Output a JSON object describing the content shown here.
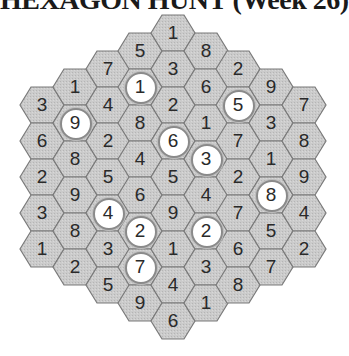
{
  "title": "HEXAGON HUNT (Week 26)",
  "colors": {
    "hex_fill": "#c9c9c9",
    "hex_border": "#7a7a7a",
    "circle_fill": "#ffffff",
    "text": "#2a2a2a"
  },
  "grid": {
    "orientation": "flat-top",
    "columns": [
      {
        "x": 42,
        "y0": 105,
        "cells": [
          {
            "v": "3"
          },
          {
            "v": "6"
          },
          {
            "v": "2"
          },
          {
            "v": "3"
          },
          {
            "v": "1"
          }
        ]
      },
      {
        "x": 75,
        "y0": 87,
        "cells": [
          {
            "v": "1"
          },
          {
            "v": "9",
            "c": true
          },
          {
            "v": "8"
          },
          {
            "v": "9"
          },
          {
            "v": "8"
          },
          {
            "v": "2"
          }
        ]
      },
      {
        "x": 108,
        "y0": 69,
        "cells": [
          {
            "v": "7"
          },
          {
            "v": "4"
          },
          {
            "v": "2"
          },
          {
            "v": "5"
          },
          {
            "v": "4",
            "c": true
          },
          {
            "v": "3"
          },
          {
            "v": "5"
          }
        ]
      },
      {
        "x": 140,
        "y0": 51,
        "cells": [
          {
            "v": "5"
          },
          {
            "v": "1",
            "c": true
          },
          {
            "v": "8"
          },
          {
            "v": "4"
          },
          {
            "v": "6"
          },
          {
            "v": "2",
            "c": true
          },
          {
            "v": "7",
            "c": true
          },
          {
            "v": "9"
          }
        ]
      },
      {
        "x": 173,
        "y0": 33,
        "cells": [
          {
            "v": "1"
          },
          {
            "v": "3"
          },
          {
            "v": "2"
          },
          {
            "v": "6",
            "c": true
          },
          {
            "v": "5"
          },
          {
            "v": "9"
          },
          {
            "v": "1"
          },
          {
            "v": "4"
          },
          {
            "v": "6"
          }
        ]
      },
      {
        "x": 206,
        "y0": 51,
        "cells": [
          {
            "v": "8"
          },
          {
            "v": "6"
          },
          {
            "v": "1"
          },
          {
            "v": "3",
            "c": true
          },
          {
            "v": "4"
          },
          {
            "v": "2",
            "c": true
          },
          {
            "v": "3"
          },
          {
            "v": "1"
          }
        ]
      },
      {
        "x": 238,
        "y0": 69,
        "cells": [
          {
            "v": "2"
          },
          {
            "v": "5",
            "c": true
          },
          {
            "v": "7"
          },
          {
            "v": "2"
          },
          {
            "v": "7"
          },
          {
            "v": "6"
          },
          {
            "v": "8"
          }
        ]
      },
      {
        "x": 271,
        "y0": 87,
        "cells": [
          {
            "v": "9"
          },
          {
            "v": "3"
          },
          {
            "v": "1"
          },
          {
            "v": "8",
            "c": true
          },
          {
            "v": "5"
          },
          {
            "v": "7"
          }
        ]
      },
      {
        "x": 304,
        "y0": 105,
        "cells": [
          {
            "v": "7"
          },
          {
            "v": "8"
          },
          {
            "v": "9"
          },
          {
            "v": "4"
          },
          {
            "v": "2"
          }
        ]
      }
    ]
  }
}
